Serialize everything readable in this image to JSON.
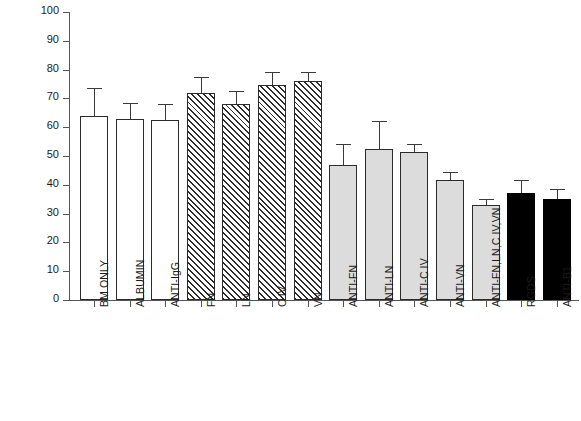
{
  "chart_data": {
    "type": "bar",
    "title": "",
    "xlabel": "",
    "ylabel": "% ATTACHMENT",
    "ylim": [
      0,
      100
    ],
    "ytick_labels": [
      "0",
      "10",
      "20",
      "30",
      "40",
      "50",
      "60",
      "70",
      "80",
      "90",
      "100"
    ],
    "ytick_values": [
      0,
      10,
      20,
      30,
      40,
      50,
      60,
      70,
      80,
      90,
      100
    ],
    "grid": false,
    "legend": "none",
    "categories": [
      "BM ONLY",
      "ALBUMIN",
      "ANTI-IgG",
      "FN",
      "LN",
      "C IV",
      "VN",
      "ANTI-FN",
      "ANTI-LN",
      "ANTI-C IV",
      "ANTI-VN",
      "ANTI-FN,LN,C IV,VN",
      "RGDS",
      "ANTI-B1"
    ],
    "values": [
      64,
      63,
      62.5,
      72,
      68,
      74.5,
      76,
      47,
      52.5,
      51.5,
      41.5,
      33,
      37,
      35
    ],
    "errors": [
      9.5,
      5.5,
      5.5,
      5.5,
      4.5,
      4.5,
      3.0,
      7.0,
      9.5,
      2.5,
      3.0,
      2.0,
      4.5,
      3.5
    ],
    "bar_styles": [
      "open",
      "open",
      "open",
      "hatch",
      "hatch",
      "hatch",
      "hatch",
      "gray",
      "gray",
      "gray",
      "gray",
      "gray",
      "black",
      "black"
    ],
    "colors": {
      "open": "#ffffff",
      "hatch": "#ffffff",
      "gray": "#dcdcdc",
      "black": "#000000",
      "outline": "#2b2b2b",
      "axis": "#555555",
      "text": "#1a1a1a"
    }
  }
}
